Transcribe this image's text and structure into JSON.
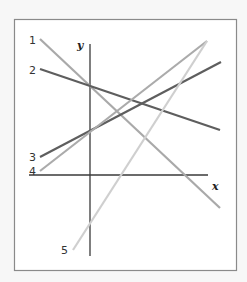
{
  "diagram": {
    "axes": {
      "x_label": "x",
      "y_label": "y"
    },
    "lines": [
      {
        "id": "1",
        "label": "1",
        "color": "#a9a9a9",
        "slope_sign": "negative",
        "y_intercept": "positive"
      },
      {
        "id": "2",
        "label": "2",
        "color": "#5e5e5e",
        "slope_sign": "negative",
        "y_intercept": "positive"
      },
      {
        "id": "3",
        "label": "3",
        "color": "#5e5e5e",
        "slope_sign": "positive",
        "y_intercept": "positive"
      },
      {
        "id": "4",
        "label": "4",
        "color": "#ababab",
        "slope_sign": "positive",
        "y_intercept": "positive"
      },
      {
        "id": "5",
        "label": "5",
        "color": "#cfcfcf",
        "slope_sign": "positive",
        "y_intercept": "negative"
      }
    ]
  }
}
